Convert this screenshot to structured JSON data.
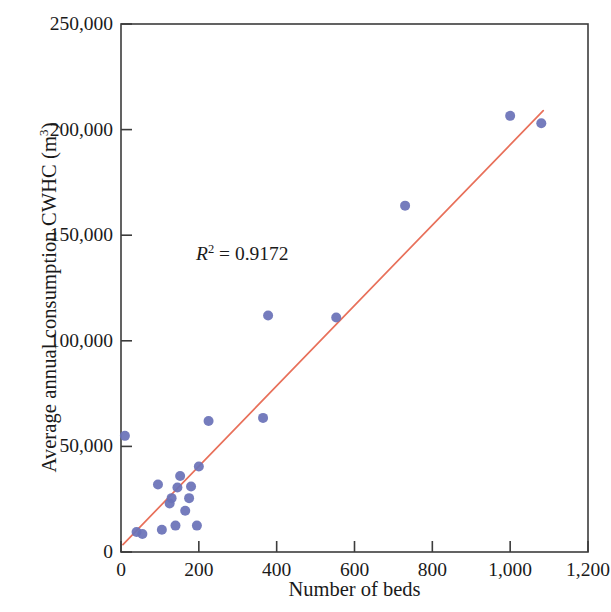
{
  "chart_data": {
    "type": "scatter",
    "title": "",
    "xlabel": "Number of beds",
    "ylabel": "Average annual consumption CWHC (m3)",
    "ylabel_base": "Average annual consumption CWHC (m",
    "ylabel_sup": "3",
    "ylabel_close": ")",
    "xlim": [
      0,
      1200
    ],
    "ylim": [
      0,
      250000
    ],
    "xticks": [
      0,
      200,
      400,
      600,
      800,
      1000,
      1200
    ],
    "xtick_labels": [
      "0",
      "200",
      "400",
      "600",
      "800",
      "1,000",
      "1,200"
    ],
    "yticks": [
      0,
      50000,
      100000,
      150000,
      200000,
      250000
    ],
    "ytick_labels": [
      "0",
      "50,000",
      "100,000",
      "150,000",
      "200,000",
      "250,000"
    ],
    "grid": false,
    "legend": "none",
    "marker_color": "#6b72b8",
    "marker_radius": 5,
    "trendline_color": "#e8705a",
    "frame_color": "#3c3c3c",
    "annotations": [
      {
        "name": "r-squared",
        "symbol": "R",
        "superscript": "2",
        "equals": " = ",
        "value": "0.9172",
        "full_text": "R2 = 0.9172",
        "x": 370,
        "y": 140000
      }
    ],
    "trendline": {
      "name": "linear-fit",
      "x_start": 5,
      "y_start": 3500,
      "x_end": 1085,
      "y_end": 209000
    },
    "points": [
      {
        "x": 10,
        "y": 55000
      },
      {
        "x": 40,
        "y": 9500
      },
      {
        "x": 55,
        "y": 8500
      },
      {
        "x": 95,
        "y": 32000
      },
      {
        "x": 105,
        "y": 10500
      },
      {
        "x": 125,
        "y": 23000
      },
      {
        "x": 130,
        "y": 25500
      },
      {
        "x": 140,
        "y": 12500
      },
      {
        "x": 145,
        "y": 30500
      },
      {
        "x": 152,
        "y": 36000
      },
      {
        "x": 165,
        "y": 19500
      },
      {
        "x": 175,
        "y": 25500
      },
      {
        "x": 180,
        "y": 31000
      },
      {
        "x": 195,
        "y": 12500
      },
      {
        "x": 200,
        "y": 40500
      },
      {
        "x": 225,
        "y": 62000
      },
      {
        "x": 365,
        "y": 63500
      },
      {
        "x": 378,
        "y": 112000
      },
      {
        "x": 553,
        "y": 111000
      },
      {
        "x": 730,
        "y": 164000
      },
      {
        "x": 1000,
        "y": 206500
      },
      {
        "x": 1080,
        "y": 203000
      }
    ]
  },
  "axes": {
    "x_title": "Number of beds",
    "y_title_base": "Average annual consumption CWHC (m",
    "y_title_sup": "3",
    "y_title_close": ")"
  }
}
